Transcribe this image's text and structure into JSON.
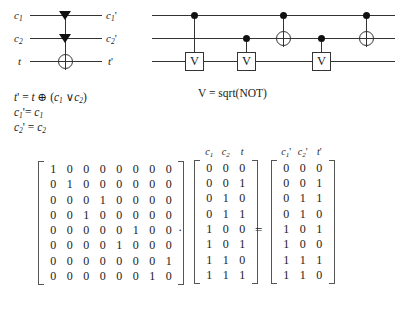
{
  "left_circuit": {
    "input_labels": [
      "c1",
      "c2",
      "t"
    ],
    "input_labels_text": [
      "c",
      "c",
      "t"
    ],
    "input_subs": [
      "1",
      "2",
      ""
    ],
    "output_labels_text": [
      "c",
      "c",
      "t"
    ],
    "output_subs": [
      "1",
      "2",
      ""
    ],
    "output_primes": [
      "'",
      "'",
      "'"
    ],
    "gate_symbols": [
      "triangle-control",
      "triangle-control",
      "xor-target"
    ]
  },
  "equations": [
    {
      "lhs": "t",
      "lhs_prime": "'",
      "lhs_sub": "",
      "rhs": "= t ⊕ (c₁ ∨c₂)"
    },
    {
      "lhs": "c",
      "lhs_prime": "'",
      "lhs_sub": "1",
      "rhs": "= c₁"
    },
    {
      "lhs": "c",
      "lhs_prime": "'",
      "lhs_sub": "2",
      "rhs": "= c₂"
    }
  ],
  "equation_lines": [
    "t' = t ⊕ (c1 ∨ c2)",
    "c1' = c1",
    "c2' = c2"
  ],
  "right_circuit": {
    "gate_label": "V",
    "note": "V = sqrt(NOT)",
    "wires": 3,
    "elements": [
      {
        "type": "control-dot",
        "wire": 0,
        "step": 0
      },
      {
        "type": "v-gate",
        "wire": 2,
        "step": 0,
        "label": "V"
      },
      {
        "type": "control-dot",
        "wire": 1,
        "step": 1
      },
      {
        "type": "v-gate",
        "wire": 2,
        "step": 1,
        "label": "V"
      },
      {
        "type": "control-dot",
        "wire": 0,
        "step": 2
      },
      {
        "type": "xor-target",
        "wire": 1,
        "step": 2
      },
      {
        "type": "control-dot",
        "wire": 1,
        "step": 3
      },
      {
        "type": "v-gate",
        "wire": 2,
        "step": 3,
        "label": "V"
      },
      {
        "type": "control-dot",
        "wire": 0,
        "step": 4
      },
      {
        "type": "xor-target",
        "wire": 1,
        "step": 4
      }
    ]
  },
  "matrix_equation": {
    "operator_multiply": "·",
    "operator_equals": "=",
    "permutation_matrix": {
      "rows": 8,
      "cols": 8,
      "values": [
        [
          1,
          0,
          0,
          0,
          0,
          0,
          0,
          0
        ],
        [
          0,
          1,
          0,
          0,
          0,
          0,
          0,
          0
        ],
        [
          0,
          0,
          0,
          1,
          0,
          0,
          0,
          0
        ],
        [
          0,
          0,
          1,
          0,
          0,
          0,
          0,
          0
        ],
        [
          0,
          0,
          0,
          0,
          0,
          1,
          0,
          0
        ],
        [
          0,
          0,
          0,
          0,
          1,
          0,
          0,
          0
        ],
        [
          0,
          0,
          0,
          0,
          0,
          0,
          0,
          1
        ],
        [
          0,
          0,
          0,
          0,
          0,
          0,
          1,
          0
        ]
      ]
    },
    "input_matrix": {
      "headers": [
        "c",
        "c",
        "t"
      ],
      "header_subs": [
        "1",
        "2",
        ""
      ],
      "header_primes": [
        "",
        "",
        ""
      ],
      "rows": 8,
      "cols": 3,
      "values": [
        [
          0,
          0,
          0
        ],
        [
          0,
          0,
          1
        ],
        [
          0,
          1,
          0
        ],
        [
          0,
          1,
          1
        ],
        [
          1,
          0,
          0
        ],
        [
          1,
          0,
          1
        ],
        [
          1,
          1,
          0
        ],
        [
          1,
          1,
          1
        ]
      ]
    },
    "output_matrix": {
      "headers": [
        "c",
        "c",
        "t"
      ],
      "header_subs": [
        "1",
        "2",
        ""
      ],
      "header_primes": [
        "'",
        "'",
        "'"
      ],
      "rows": 8,
      "cols": 3,
      "values": [
        [
          0,
          0,
          0
        ],
        [
          0,
          0,
          1
        ],
        [
          0,
          1,
          1
        ],
        [
          0,
          1,
          0
        ],
        [
          1,
          0,
          1
        ],
        [
          1,
          0,
          0
        ],
        [
          1,
          1,
          1
        ],
        [
          1,
          1,
          0
        ]
      ]
    }
  },
  "colors": {
    "background": "#ffffff",
    "ink": "#1a1a1a",
    "line": "#333333",
    "bracket": "#555555"
  }
}
